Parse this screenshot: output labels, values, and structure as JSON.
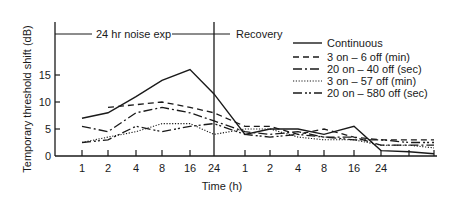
{
  "chart_data": {
    "type": "line",
    "title": "",
    "xlabel": "Time (h)",
    "ylabel": "Temporary threshold shift (dB)",
    "ylim": [
      0,
      19
    ],
    "yticks": [
      0,
      5,
      10,
      15
    ],
    "grid": false,
    "legend_position": "upper right",
    "phases": [
      {
        "label": "24 hr noise exp",
        "x_ticks": [
          "1",
          "2",
          "4",
          "8",
          "16",
          "24"
        ]
      },
      {
        "label": "Recovery",
        "x_ticks": [
          "1",
          "2",
          "4",
          "8",
          "16",
          "24",
          "",
          ""
        ]
      }
    ],
    "categories": [
      "E1",
      "E2",
      "E4",
      "E8",
      "E16",
      "E24",
      "R1",
      "R2",
      "R4",
      "R8",
      "R16",
      "R24",
      "R+1",
      "R+2"
    ],
    "x_tick_labels": [
      "1",
      "2",
      "4",
      "8",
      "16",
      "24",
      "1",
      "2",
      "4",
      "8",
      "16",
      "24",
      "",
      ""
    ],
    "series": [
      {
        "name": "Continuous",
        "style": "solid",
        "values": [
          7,
          8,
          11,
          14,
          16,
          11.5,
          4,
          5,
          5,
          4,
          5.5,
          1,
          0.8,
          0.4
        ]
      },
      {
        "name": "3 on – 6 off (min)",
        "style": "dashed",
        "values": [
          null,
          9,
          9.5,
          10,
          9,
          8,
          5.5,
          5.5,
          4,
          5,
          3.5,
          3,
          3,
          3
        ]
      },
      {
        "name": "20 on – 40 off (sec)",
        "style": "dash-dot",
        "values": [
          5.5,
          4.5,
          8,
          9,
          8,
          6.5,
          4.5,
          4,
          4.5,
          3.5,
          3.5,
          2,
          2,
          2
        ]
      },
      {
        "name": "3 on – 57 off (min)",
        "style": "dotted",
        "values": [
          2.5,
          3.5,
          4.5,
          6,
          6,
          4,
          5,
          5,
          3.5,
          3,
          3,
          2,
          2,
          1.5
        ]
      },
      {
        "name": "20 on – 580 off (sec)",
        "style": "dash-dot-dot",
        "values": [
          2.5,
          3,
          5.5,
          4.5,
          5.5,
          6,
          4,
          3.5,
          4,
          3.5,
          3,
          3,
          2.5,
          2.5
        ]
      }
    ]
  },
  "labels": {
    "exposure": "24 hr noise exp",
    "recovery": "Recovery",
    "xlabel": "Time (h)",
    "ylabel": "Temporary threshold shift (dB)",
    "yticks": [
      "0",
      "5",
      "10",
      "15"
    ],
    "xticks": [
      "1",
      "2",
      "4",
      "8",
      "16",
      "24",
      "1",
      "2",
      "4",
      "8",
      "16",
      "24"
    ]
  },
  "legend": [
    {
      "label": "Continuous"
    },
    {
      "label": "3 on – 6 off (min)"
    },
    {
      "label": "20 on – 40 off (sec)"
    },
    {
      "label": "3 on – 57 off (min)"
    },
    {
      "label": "20 on – 580 off (sec)"
    }
  ],
  "colors": {
    "ink": "#1a1a1a",
    "background": "#ffffff"
  }
}
